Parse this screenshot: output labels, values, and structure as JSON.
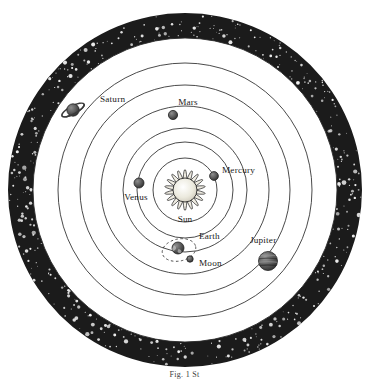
{
  "figure": {
    "caption": "Fig. 1 St",
    "background_color": "#ffffff",
    "starfield_color": "#1b1b1b",
    "star_color": "#f2f2f2",
    "orbit_color": "#2b2b2b",
    "label_color": "#1a1a1a"
  },
  "center": {
    "x": 185,
    "y": 190
  },
  "starfield_ring": {
    "outer_radius": 177,
    "inner_radius": 152,
    "star_count": 420
  },
  "orbits": [
    {
      "name": "mercury-orbit",
      "radius": 32
    },
    {
      "name": "venus-orbit",
      "radius": 48
    },
    {
      "name": "earth-orbit",
      "radius": 62
    },
    {
      "name": "mars-orbit",
      "radius": 84
    },
    {
      "name": "jupiter-orbit",
      "radius": 105
    },
    {
      "name": "saturn-orbit",
      "radius": 127
    }
  ],
  "sun": {
    "label": "Sun",
    "core_radius": 12,
    "ray_outer_radius": 21,
    "ray_count": 18,
    "x": 185,
    "y": 190,
    "label_x": 185,
    "label_y": 222,
    "color": "#e8e4da"
  },
  "bodies": [
    {
      "name": "mercury",
      "label": "Mercury",
      "x": 214,
      "y": 176,
      "radius": 4.4,
      "label_x": 222,
      "label_y": 173,
      "label_anchor": "start",
      "color": "#555555"
    },
    {
      "name": "venus",
      "label": "Venus",
      "x": 139,
      "y": 183,
      "radius": 5.0,
      "label_x": 136,
      "label_y": 200,
      "label_anchor": "middle",
      "color": "#5a5a5a"
    },
    {
      "name": "earth",
      "label": "Earth",
      "x": 178,
      "y": 248,
      "radius": 6.0,
      "label_x": 199,
      "label_y": 239,
      "label_anchor": "start",
      "color": "#4a4a4a"
    },
    {
      "name": "moon",
      "label": "Moon",
      "x": 190,
      "y": 259,
      "radius": 3.2,
      "label_x": 199,
      "label_y": 266,
      "label_anchor": "start",
      "color": "#505050"
    },
    {
      "name": "mars",
      "label": "Mars",
      "x": 173,
      "y": 115,
      "radius": 4.6,
      "label_x": 188,
      "label_y": 105,
      "label_anchor": "middle",
      "color": "#5c5c5c"
    },
    {
      "name": "jupiter",
      "label": "Jupiter",
      "x": 268,
      "y": 261,
      "radius": 9.5,
      "label_x": 250,
      "label_y": 243,
      "label_anchor": "start",
      "color": "#555555"
    },
    {
      "name": "saturn",
      "label": "Saturn",
      "x": 73,
      "y": 110,
      "radius": 6.2,
      "ring_rx": 12.5,
      "ring_ry": 4.0,
      "ring_rotation": -28,
      "label_x": 100,
      "label_y": 102,
      "label_anchor": "start",
      "color": "#565656"
    }
  ],
  "moon_orbit": {
    "name": "moon-orbit-dashed",
    "cx": 179,
    "cy": 250,
    "rx": 17,
    "ry": 11,
    "rotation": -12,
    "dash": "2.5,2.5"
  }
}
